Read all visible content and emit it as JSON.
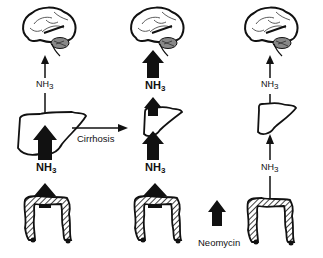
{
  "diagram": {
    "ammonia_label": "NH",
    "ammonia_subscript": "3",
    "transition_label": "Cirrhosis",
    "treatment_label": "Neomycin",
    "columns": [
      {
        "state": "normal",
        "liver": "normal liver",
        "gut_ammonia": "large",
        "liver_to_brain": "small"
      },
      {
        "state": "cirrhosis",
        "liver": "shrunken cirrhotic liver",
        "gut_ammonia": "large",
        "liver_to_brain": "large"
      },
      {
        "state": "cirrhosis + neomycin",
        "liver": "shrunken cirrhotic liver",
        "gut_ammonia": "small",
        "liver_to_brain": "small"
      }
    ]
  }
}
